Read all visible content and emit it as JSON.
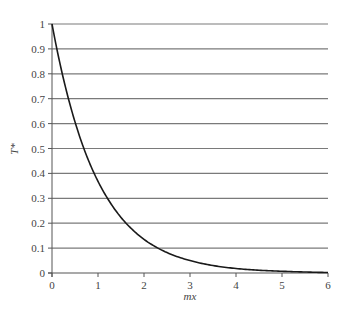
{
  "chart_data": {
    "type": "line",
    "title": "",
    "xlabel": "mx",
    "ylabel": "T*",
    "xlim": [
      0,
      6
    ],
    "ylim": [
      0,
      1
    ],
    "x_ticks": [
      0,
      1,
      2,
      3,
      4,
      5,
      6
    ],
    "x_tick_labels": [
      "0",
      "1",
      "2",
      "3",
      "4",
      "5",
      "6"
    ],
    "y_ticks": [
      0,
      0.1,
      0.2,
      0.3,
      0.4,
      0.5,
      0.6,
      0.7,
      0.8,
      0.9,
      1
    ],
    "y_tick_labels": [
      "0",
      "0.1",
      "0.2",
      "0.3",
      "0.4",
      "0.5",
      "0.6",
      "0.7",
      "0.8",
      "0.9",
      "1"
    ],
    "grid": {
      "horizontal": true,
      "vertical": false
    },
    "legend": null,
    "series": [
      {
        "name": "T* = exp(-mx)",
        "x": [
          0,
          0.25,
          0.5,
          0.75,
          1,
          1.25,
          1.5,
          1.75,
          2,
          2.5,
          3,
          3.5,
          4,
          4.5,
          5,
          5.5,
          6
        ],
        "values": [
          1.0,
          0.779,
          0.607,
          0.472,
          0.368,
          0.287,
          0.223,
          0.174,
          0.135,
          0.082,
          0.05,
          0.03,
          0.018,
          0.011,
          0.007,
          0.004,
          0.002
        ]
      }
    ]
  },
  "colors": {
    "curve": "#1a1a1a",
    "grid": "#7a7a7a",
    "axis": "#555555",
    "text": "#444444"
  }
}
